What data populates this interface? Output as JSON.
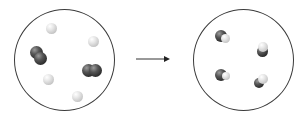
{
  "diagram": {
    "type": "reaction-scheme",
    "colors": {
      "outline": "#3a3a3a",
      "dark_atom": "#2a2a2a",
      "light_atom": "#d0d0d0",
      "arrow": "#222222",
      "background": "#ffffff"
    },
    "reactants": {
      "label": "reactants",
      "description": "2 diatomic dark molecules and 4 single light atoms",
      "particles": [
        {
          "kind": "light-atom",
          "x": 50,
          "y": 28
        },
        {
          "kind": "light-atom",
          "x": 92,
          "y": 40
        },
        {
          "kind": "dark-diatomic",
          "x": 36,
          "y": 52
        },
        {
          "kind": "dark-diatomic",
          "x": 89,
          "y": 68
        },
        {
          "kind": "light-atom",
          "x": 46,
          "y": 78
        },
        {
          "kind": "light-atom",
          "x": 76,
          "y": 95
        }
      ]
    },
    "arrow": {
      "label": "reaction-arrow",
      "direction": "right"
    },
    "products": {
      "label": "products",
      "description": "4 molecules each made of one dark atom bonded to one light atom",
      "particles": [
        {
          "kind": "dark-light-molecule",
          "x": 222,
          "y": 34
        },
        {
          "kind": "dark-light-molecule",
          "x": 262,
          "y": 46
        },
        {
          "kind": "dark-light-molecule",
          "x": 221,
          "y": 73
        },
        {
          "kind": "dark-light-molecule",
          "x": 259,
          "y": 80
        }
      ]
    }
  }
}
